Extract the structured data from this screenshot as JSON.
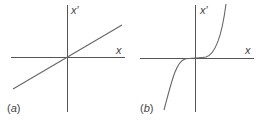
{
  "panels": [
    {
      "id": "a",
      "label": "(a)",
      "label_letter": "a",
      "x_axis_label": "x",
      "y_axis_label": "x′",
      "curve": "linear",
      "description": "straight line through origin with positive slope"
    },
    {
      "id": "b",
      "label": "(b)",
      "label_letter": "b",
      "x_axis_label": "x",
      "y_axis_label": "x′",
      "curve": "cubic",
      "description": "cubic-like curve, flat at origin, steep at ends"
    }
  ],
  "colors": {
    "axis": "#555555",
    "curve": "#666666",
    "text": "#444444",
    "background": "#ffffff"
  }
}
